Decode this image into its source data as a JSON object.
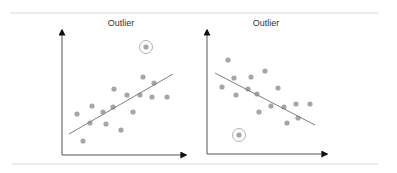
{
  "colors": {
    "background": "#ffffff",
    "rule": "#d9d9d9",
    "axis": "#555555",
    "arrowhead": "#111111",
    "point": "#a6a6a6",
    "trend_line": "#7f7f7f",
    "outlier_ring": "#b3b3b3",
    "title": "#333333"
  },
  "chart_data": [
    {
      "type": "scatter",
      "title": "Outlier",
      "xlabel": "",
      "ylabel": "",
      "trend": "positive",
      "points": [
        [
          77,
          114
        ],
        [
          92,
          106
        ],
        [
          90,
          123
        ],
        [
          103,
          112
        ],
        [
          106,
          124
        ],
        [
          113,
          107
        ],
        [
          114,
          89
        ],
        [
          121,
          130
        ],
        [
          83,
          141
        ],
        [
          127,
          95
        ],
        [
          143,
          77
        ],
        [
          154,
          83
        ],
        [
          140,
          95
        ],
        [
          152,
          97
        ],
        [
          167,
          97
        ],
        [
          133,
          112
        ]
      ],
      "trend_line": [
        [
          69,
          134
        ],
        [
          173,
          74
        ]
      ],
      "outlier": [
        146,
        47
      ],
      "axis_origin": [
        62,
        155
      ],
      "y_axis_top": 30,
      "x_axis_end": 186
    },
    {
      "type": "scatter",
      "title": "Outlier",
      "xlabel": "",
      "ylabel": "",
      "trend": "negative",
      "points": [
        [
          228,
          60
        ],
        [
          234,
          78
        ],
        [
          251,
          77
        ],
        [
          265,
          71
        ],
        [
          222,
          87
        ],
        [
          236,
          95
        ],
        [
          248,
          89
        ],
        [
          257,
          94
        ],
        [
          278,
          88
        ],
        [
          259,
          112
        ],
        [
          271,
          106
        ],
        [
          284,
          107
        ],
        [
          296,
          104
        ],
        [
          310,
          104
        ],
        [
          287,
          123
        ],
        [
          298,
          118
        ]
      ],
      "trend_line": [
        [
          215,
          73
        ],
        [
          315,
          125
        ]
      ],
      "outlier": [
        239,
        135
      ],
      "axis_origin": [
        207,
        154
      ],
      "y_axis_top": 30,
      "x_axis_end": 327
    }
  ],
  "labels": {
    "left_title": "Outlier",
    "right_title": "Outlier"
  }
}
